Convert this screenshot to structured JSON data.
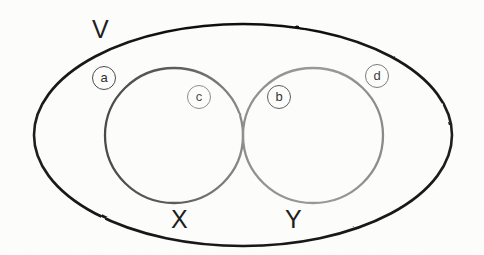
{
  "diagram": {
    "kind": "venn-diagram",
    "universe": {
      "label": "V",
      "stroke_color": "#1a1a1a",
      "shape": "ellipse"
    },
    "sets": [
      {
        "id": "x",
        "label": "X",
        "stroke_color": "#595959",
        "shape": "ellipse",
        "position": "left"
      },
      {
        "id": "y",
        "label": "Y",
        "stroke_color": "#8c8c8c",
        "shape": "ellipse",
        "position": "right"
      }
    ],
    "regions": [
      {
        "id": "a",
        "label": "a",
        "meaning": "inside V, outside X and Y"
      },
      {
        "id": "c",
        "label": "c",
        "meaning": "inside X only"
      },
      {
        "id": "b",
        "label": "b",
        "meaning": "inside Y only"
      },
      {
        "id": "d",
        "label": "d",
        "meaning": "inside V, outside X and Y"
      }
    ],
    "colors": {
      "background": "#fdfdfc",
      "universe_stroke": "#1a1a1a",
      "set_x_stroke": "#595959",
      "set_y_stroke": "#8c8c8c",
      "text": "#1c1c1c"
    }
  }
}
